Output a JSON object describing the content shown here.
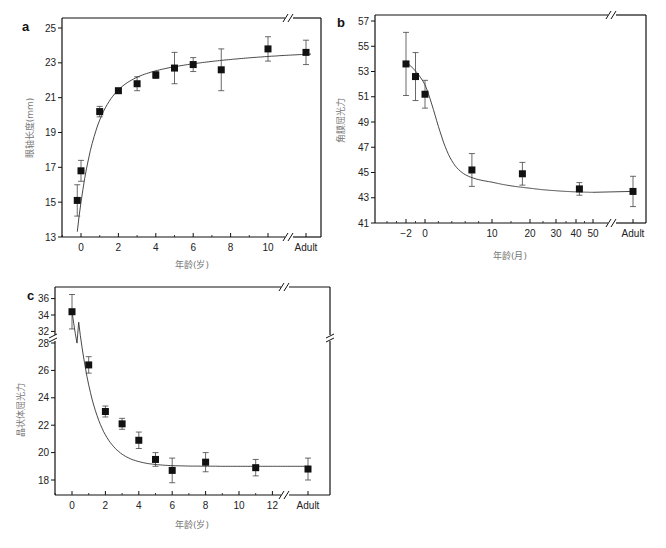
{
  "chart_data": [
    {
      "id": "a",
      "type": "scatter",
      "panel_label": "a",
      "title": "",
      "xlabel": "年龄(岁)",
      "ylabel": "眼轴长度(mm)",
      "ylim": [
        13,
        25
      ],
      "yticks": [
        13,
        15,
        17,
        19,
        21,
        23,
        25
      ],
      "xticks": [
        {
          "v": 0,
          "label": "0"
        },
        {
          "v": 2,
          "label": "2"
        },
        {
          "v": 4,
          "label": "4"
        },
        {
          "v": 6,
          "label": "6"
        },
        {
          "v": 8,
          "label": "8"
        },
        {
          "v": 10,
          "label": "10"
        },
        {
          "v": "Adult",
          "label": "Adult"
        }
      ],
      "axis_break": "x between 10 and Adult",
      "grid": false,
      "series": [
        {
          "name": "Axial length",
          "x": [
            -0.2,
            0,
            1,
            2,
            3,
            4,
            5,
            6,
            7.5,
            10,
            "Adult"
          ],
          "y": [
            15.1,
            16.8,
            20.2,
            21.4,
            21.8,
            22.3,
            22.7,
            22.9,
            22.6,
            23.8,
            23.6
          ],
          "err": [
            0.9,
            0.6,
            0.3,
            0.1,
            0.4,
            0.2,
            0.9,
            0.4,
            1.2,
            0.7,
            0.7
          ]
        }
      ],
      "fit_curve": true
    },
    {
      "id": "b",
      "type": "scatter",
      "panel_label": "b",
      "title": "",
      "xlabel": "年龄(月)",
      "ylabel": "角膜屈光力",
      "ylim": [
        41,
        57
      ],
      "yticks": [
        41,
        43,
        45,
        47,
        49,
        51,
        53,
        55,
        57
      ],
      "xticks": [
        {
          "v": -2,
          "label": "−2"
        },
        {
          "v": 0,
          "label": "0"
        },
        {
          "v": 10,
          "label": "10"
        },
        {
          "v": 20,
          "label": "20"
        },
        {
          "v": 30,
          "label": "30"
        },
        {
          "v": 40,
          "label": "40"
        },
        {
          "v": 50,
          "label": "50"
        },
        {
          "v": "Adult",
          "label": "Adult"
        }
      ],
      "x_scale": "log-like (compressed)",
      "axis_break": "x between 50 and Adult",
      "grid": false,
      "series": [
        {
          "name": "Corneal power",
          "x": [
            -2,
            -1,
            0,
            7,
            18,
            42,
            "Adult"
          ],
          "y": [
            53.6,
            52.6,
            51.2,
            45.2,
            44.9,
            43.7,
            43.5
          ],
          "err": [
            2.5,
            1.9,
            1.1,
            1.3,
            0.9,
            0.5,
            1.2
          ]
        }
      ],
      "fit_curve": true
    },
    {
      "id": "c",
      "type": "scatter",
      "panel_label": "c",
      "title": "",
      "xlabel": "年龄(岁)",
      "ylabel": "晶状体屈光力",
      "ylim": [
        17,
        37
      ],
      "yticks": [
        18,
        20,
        22,
        24,
        26,
        28,
        32,
        34,
        36
      ],
      "axis_break": "y between 28 and 32; x between 12 and Adult",
      "xticks": [
        {
          "v": 0,
          "label": "0"
        },
        {
          "v": 2,
          "label": "2"
        },
        {
          "v": 4,
          "label": "4"
        },
        {
          "v": 6,
          "label": "6"
        },
        {
          "v": 8,
          "label": "8"
        },
        {
          "v": 10,
          "label": "10"
        },
        {
          "v": 12,
          "label": "12"
        },
        {
          "v": "Adult",
          "label": "Adult"
        }
      ],
      "grid": false,
      "series": [
        {
          "name": "Lens power",
          "x": [
            0,
            1,
            2,
            3,
            4,
            5,
            6,
            8,
            11,
            "Adult"
          ],
          "y": [
            34.4,
            26.4,
            23.0,
            22.1,
            20.9,
            19.5,
            18.7,
            19.3,
            18.9,
            18.8
          ],
          "err": [
            2.1,
            0.6,
            0.4,
            0.4,
            0.6,
            0.5,
            0.9,
            0.7,
            0.6,
            0.8
          ]
        }
      ],
      "fit_curve": true
    }
  ],
  "labels": {
    "a": {
      "panel": "a",
      "xlabel": "年龄(岁)",
      "ylabel": "眼轴长度(mm)"
    },
    "b": {
      "panel": "b",
      "xlabel": "年龄(月)",
      "ylabel": "角膜屈光力"
    },
    "c": {
      "panel": "c",
      "xlabel": "年龄(岁)",
      "ylabel": "晶状体屈光力"
    }
  }
}
